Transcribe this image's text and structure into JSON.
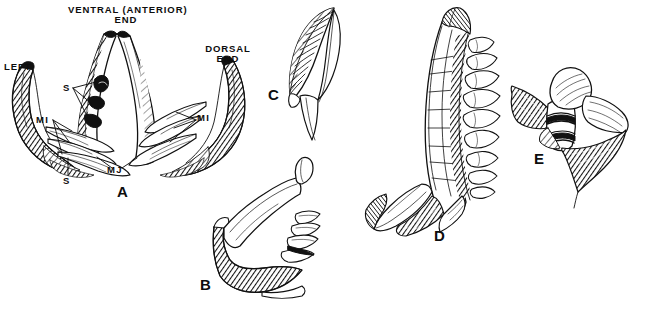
{
  "figure": {
    "kind": "scientific-line-drawing-plate",
    "background_color": "#ffffff",
    "ink_color": "#111111",
    "headings": {
      "ventral_anterior": "VENTRAL (ANTERIOR)\nEND",
      "dorsal": "DORSAL\nEND",
      "left": "LEFT"
    },
    "anatomical_labels": {
      "s_upper": "S",
      "s_lower": "S",
      "mi_left": "MI",
      "mi_right": "MI",
      "mj": "MJ"
    },
    "panels": [
      {
        "id": "A",
        "label": "A",
        "caption": "paired V-shaped jaw apparatus, ventral view"
      },
      {
        "id": "B",
        "label": "B",
        "caption": "hooked jaw element with digitate processes"
      },
      {
        "id": "C",
        "label": "C",
        "caption": "curved ribbed comb-like plate"
      },
      {
        "id": "D",
        "label": "D",
        "caption": "J-shaped maxilla with tooth row"
      },
      {
        "id": "E",
        "label": "E",
        "caption": "bulbous element with flanged wings"
      }
    ]
  }
}
